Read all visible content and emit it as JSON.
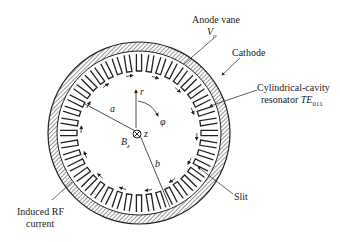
{
  "labels": {
    "anode_vane": "Anode vane",
    "vo": "V",
    "vo_sub": "o",
    "cathode": "Cathode",
    "resonator_line1": "Cylindrical-cavity",
    "resonator_line2": "resonator ",
    "resonator_te": "TE",
    "resonator_sub": "011",
    "slit": "Slit",
    "induced_line1": "Induced RF",
    "induced_line2": "current",
    "a": "a",
    "b": "b",
    "r": "r",
    "phi": "φ",
    "z": "z",
    "bz": "B",
    "bz_sub": "z"
  },
  "colors": {
    "ink": "#222222",
    "background": "#ffffff"
  }
}
